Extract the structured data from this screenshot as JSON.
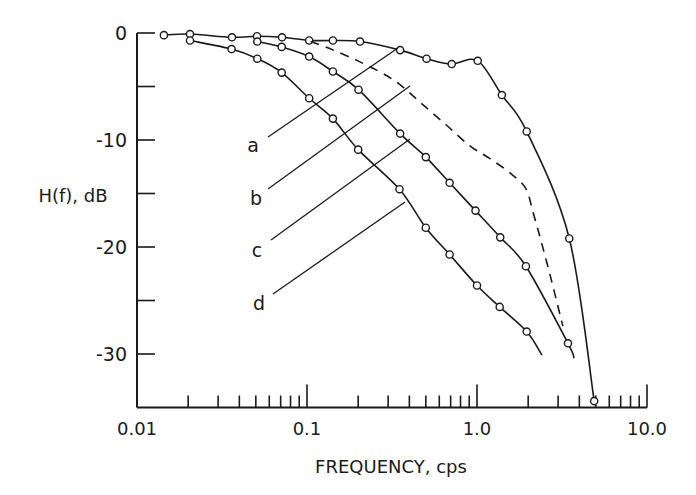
{
  "chart_data": {
    "type": "line",
    "title": "",
    "xlabel": "FREQUENCY, cps",
    "ylabel": "H(f), dB",
    "xscale": "log",
    "xlim": [
      0.01,
      10.0
    ],
    "ylim": [
      -35,
      0
    ],
    "grid": false,
    "legend": "inline leader-line labels a, b, c, d",
    "x_tick_labels": [
      "0.01",
      "0.1",
      "1.0",
      "10.0"
    ],
    "x_major_ticks": [
      0.01,
      0.1,
      1.0,
      10.0
    ],
    "y_tick_labels": [
      "0",
      "-10",
      "-20",
      "-30"
    ],
    "y_major_ticks": [
      0,
      -10,
      -20,
      -30
    ],
    "y_minor_ticks": [
      -5,
      -15,
      -25
    ],
    "series": [
      {
        "name": "a",
        "style": "solid",
        "markers": true,
        "x": [
          0.0144,
          0.0205,
          0.0362,
          0.0508,
          0.0713,
          0.103,
          0.142,
          0.205,
          0.353,
          0.505,
          0.71,
          1.01,
          1.4,
          1.96,
          3.49,
          4.89
        ],
        "y": [
          -0.2,
          -0.1,
          -0.4,
          -0.3,
          -0.4,
          -0.7,
          -0.7,
          -0.8,
          -1.6,
          -2.4,
          -2.9,
          -2.6,
          -5.8,
          -9.2,
          -19.2,
          -34.4
        ],
        "curve_end": null
      },
      {
        "name": "b",
        "style": "dashed",
        "markers": false,
        "x": [
          0.105,
          0.143,
          0.205,
          0.295,
          0.37,
          0.48,
          0.66,
          0.9,
          1.18,
          1.54,
          1.93,
          2.14,
          2.35,
          2.55,
          2.8,
          3.2
        ],
        "y": [
          -0.8,
          -1.6,
          -2.7,
          -4.0,
          -5.1,
          -6.7,
          -8.6,
          -10.5,
          -11.7,
          -13.0,
          -14.5,
          -16.8,
          -19.1,
          -21.2,
          -23.7,
          -27.4
        ],
        "curve_end": null
      },
      {
        "name": "c",
        "style": "solid",
        "markers": true,
        "x": [
          0.051,
          0.071,
          0.103,
          0.142,
          0.201,
          0.353,
          0.5,
          0.69,
          0.98,
          1.37,
          1.94,
          3.43
        ],
        "y": [
          -0.8,
          -1.3,
          -2.2,
          -3.6,
          -5.3,
          -9.4,
          -11.6,
          -14.0,
          -16.6,
          -19.1,
          -21.8,
          -29.0
        ],
        "curve_end": {
          "x": 3.72,
          "y": -30.4
        }
      },
      {
        "name": "d",
        "style": "solid",
        "markers": true,
        "x": [
          0.0205,
          0.036,
          0.051,
          0.071,
          0.103,
          0.142,
          0.2,
          0.35,
          0.5,
          0.69,
          1.0,
          1.36,
          1.96
        ],
        "y": [
          -0.7,
          -1.5,
          -2.4,
          -3.7,
          -6.1,
          -8.0,
          -10.9,
          -14.6,
          -18.2,
          -20.7,
          -23.6,
          -25.6,
          -27.9
        ],
        "curve_end": {
          "x": 2.41,
          "y": -30.1
        }
      }
    ],
    "annotations": [
      {
        "text": "a",
        "label_pos": [
          253,
          145
        ],
        "leader": [
          [
            268,
            137
          ],
          [
            398,
            48
          ]
        ]
      },
      {
        "text": "b",
        "label_pos": [
          256,
          198
        ],
        "leader": [
          [
            268,
            189
          ],
          [
            410,
            86
          ]
        ]
      },
      {
        "text": "c",
        "label_pos": [
          257,
          250
        ],
        "leader": [
          [
            271,
            240
          ],
          [
            410,
            139
          ]
        ]
      },
      {
        "text": "d",
        "label_pos": [
          259,
          303
        ],
        "leader": [
          [
            273,
            294
          ],
          [
            405,
            202
          ]
        ]
      }
    ]
  }
}
